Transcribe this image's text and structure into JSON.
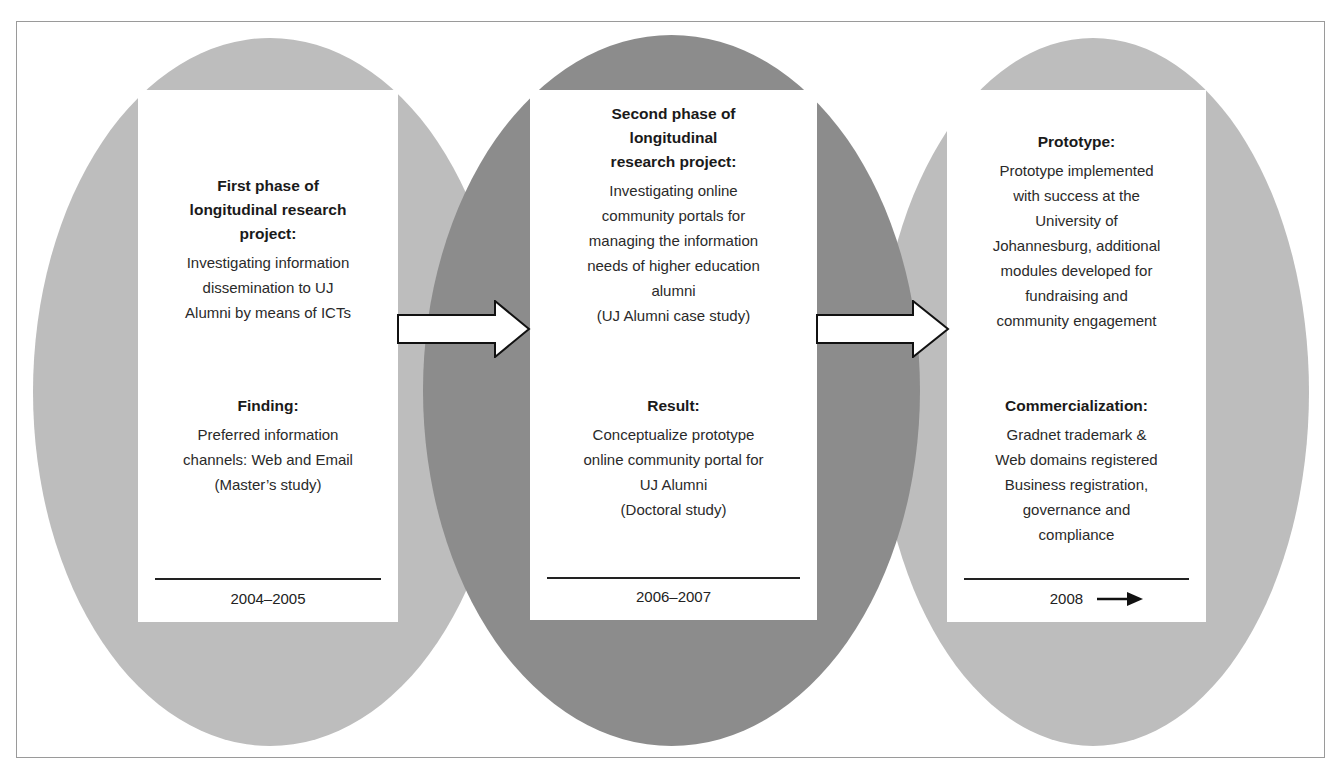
{
  "diagram": {
    "colors": {
      "outer_ellipse": "#bdbdbd",
      "middle_ellipse": "#8c8c8c",
      "card": "#ffffff",
      "frame": "#9a9a9a",
      "text": "#222222"
    },
    "phases": [
      {
        "section1_heading": "First phase of longitudinal research project:",
        "section1_heading_lines": [
          "First phase of",
          "longitudinal research",
          "project:"
        ],
        "section1_body": "Investigating information dissemination to UJ Alumni by means of ICTs",
        "section1_body_lines": [
          "Investigating information",
          "dissemination to UJ",
          "Alumni by means of ICTs"
        ],
        "section2_heading": "Finding:",
        "section2_body": "Preferred information channels: Web and Email (Master's study)",
        "section2_body_lines": [
          "Preferred information",
          "channels: Web and Email",
          "(Master’s study)"
        ],
        "date": "2004–2005"
      },
      {
        "section1_heading": "Second phase of longitudinal research project:",
        "section1_heading_lines": [
          "Second phase of",
          "longitudinal",
          "research project:"
        ],
        "section1_body": "Investigating online community portals for managing the information needs of higher education alumni (UJ Alumni case study)",
        "section1_body_lines": [
          "Investigating online",
          "community portals for",
          "managing the information",
          "needs of higher education",
          "alumni",
          "(UJ Alumni case study)"
        ],
        "section2_heading": "Result:",
        "section2_body": "Conceptualize prototype online community portal for UJ Alumni (Doctoral study)",
        "section2_body_lines": [
          "Conceptualize prototype",
          "online community portal for",
          "UJ Alumni",
          "(Doctoral study)"
        ],
        "date": "2006–2007"
      },
      {
        "section1_heading": "Prototype:",
        "section1_heading_lines": [
          "Prototype:"
        ],
        "section1_body": "Prototype implemented with success at the University of Johannesburg, additional modules developed for fundraising and community engagement",
        "section1_body_lines": [
          "Prototype implemented",
          "with success at the",
          "University of",
          "Johannesburg, additional",
          "modules developed for",
          "fundraising and",
          "community engagement"
        ],
        "section2_heading": "Commercialization:",
        "section2_body": "Gradnet trademark & Web domains registered Business registration, governance and compliance",
        "section2_body_lines": [
          "Gradnet trademark &",
          "Web domains registered",
          "Business registration,",
          "governance and",
          "compliance"
        ],
        "date": "2008",
        "date_icon": "arrow-right-icon"
      }
    ],
    "connectors": [
      {
        "from": 0,
        "to": 1,
        "icon": "block-arrow-right-icon"
      },
      {
        "from": 1,
        "to": 2,
        "icon": "block-arrow-right-icon"
      }
    ]
  }
}
